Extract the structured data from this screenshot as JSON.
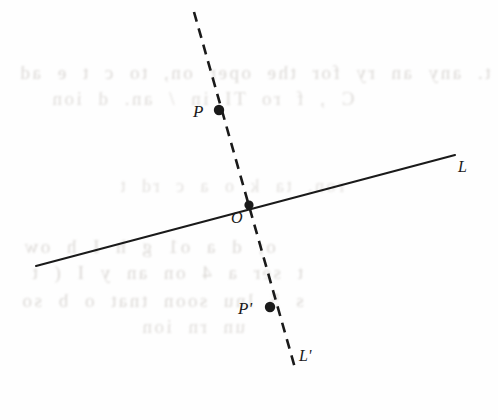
{
  "figure": {
    "kind": "geometry-diagram",
    "background_color": "#fefefe",
    "ink_color": "#1a1a1a",
    "ghost_text_color": "#b9b3ad"
  },
  "labels": {
    "point_p": "P",
    "point_o": "O",
    "point_p_prime": "P'",
    "line_l": "L",
    "line_l_prime": "L'"
  },
  "geometry": {
    "line_l": {
      "name": "L",
      "style": "solid",
      "x1": 36,
      "y1": 266,
      "x2": 455,
      "y2": 155,
      "stroke_width": 2.1
    },
    "line_l_prime": {
      "name": "L'",
      "style": "dashed",
      "x1": 194,
      "y1": 12,
      "x2": 295,
      "y2": 368,
      "stroke_width": 2.6,
      "dash": "10 7"
    },
    "points": [
      {
        "label": "P",
        "x": 219,
        "y": 110,
        "r": 5.2
      },
      {
        "label": "O",
        "x": 249,
        "y": 205,
        "r": 4.6
      },
      {
        "label": "P'",
        "x": 270,
        "y": 307,
        "r": 5.2
      }
    ]
  },
  "ghost_text": {
    "note": "illegible show-through text from the reverse side of the page",
    "lines": [
      {
        "text": "t. any  an  ry for  the  oper on,  to  c t  e  ad",
        "x": 18,
        "y": 62,
        "size": 19,
        "opacity": 0.5
      },
      {
        "text": "C  ,  f   ro  TI   in / an.   d     ion",
        "x": 50,
        "y": 88,
        "size": 19,
        "opacity": 0.46
      },
      {
        "text": "ron.  ta k  o     a  c rd t",
        "x": 118,
        "y": 176,
        "size": 18,
        "opacity": 0.4
      },
      {
        "text": "o;   d    a   o1   g   h    I       h  ow",
        "x": 22,
        "y": 236,
        "size": 19,
        "opacity": 0.5
      },
      {
        "text": "t      ser    a  4  on  an  y      I  (  t",
        "x": 30,
        "y": 262,
        "size": 19,
        "opacity": 0.5
      },
      {
        "text": "s       5     lnu  soon  tnat     o  b    so",
        "x": 20,
        "y": 290,
        "size": 19,
        "opacity": 0.5
      },
      {
        "text": "un    rn        ion",
        "x": 140,
        "y": 316,
        "size": 19,
        "opacity": 0.46
      }
    ]
  }
}
